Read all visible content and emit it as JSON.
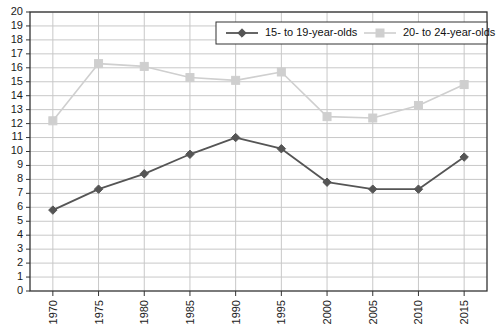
{
  "chart_data": {
    "type": "line",
    "title": "",
    "subtitle": "",
    "xlabel": "",
    "ylabel": "",
    "x": [
      1970,
      1975,
      1980,
      1985,
      1990,
      1995,
      2000,
      2005,
      2010,
      2015
    ],
    "xtick_labels": [
      "1970",
      "1975",
      "1980",
      "1985",
      "1990",
      "1995",
      "2000",
      "2005",
      "2010",
      "2015"
    ],
    "ytick_labels": [
      "20",
      "19",
      "18",
      "17",
      "16",
      "15",
      "14",
      "13",
      "12",
      "11",
      "10",
      "9",
      "8",
      "7",
      "6",
      "5",
      "4",
      "3",
      "2",
      "1",
      "0"
    ],
    "ylim": [
      0,
      20
    ],
    "ytick_step": 1,
    "xlim": [
      1967.5,
      2017.5
    ],
    "grid": true,
    "grid_color": "#c8c8c8",
    "legend_position": "top-right",
    "series": [
      {
        "name": "15- to 19-year-olds",
        "color": "#555555",
        "marker": "diamond",
        "values": [
          5.8,
          7.3,
          8.4,
          9.8,
          11.0,
          10.2,
          7.8,
          7.3,
          7.3,
          9.6
        ]
      },
      {
        "name": "20- to 24-year-olds",
        "color": "#cfcfcf",
        "marker": "square",
        "values": [
          12.2,
          16.3,
          16.1,
          15.3,
          15.1,
          15.7,
          12.5,
          12.4,
          13.3,
          14.8
        ]
      }
    ]
  },
  "legend": {
    "entries": [
      {
        "label": "15- to 19-year-olds"
      },
      {
        "label": "20- to 24-year-olds"
      }
    ]
  },
  "colors": {
    "series_dark": "#555555",
    "series_light": "#cfcfcf",
    "grid": "#c8c8c8",
    "axis": "#333333",
    "text": "#1a1a1a",
    "background": "#ffffff"
  }
}
